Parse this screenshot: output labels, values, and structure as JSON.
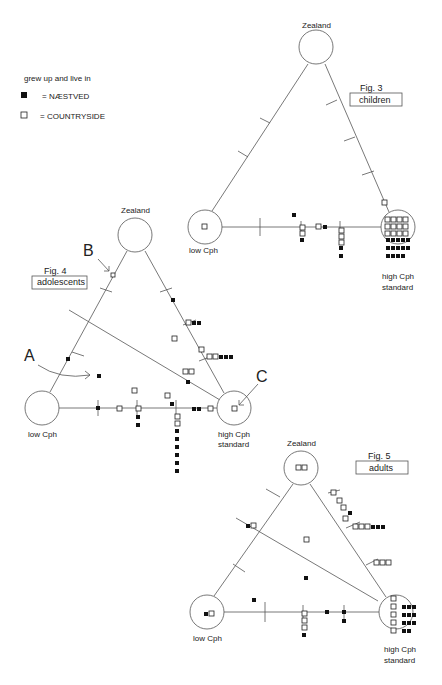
{
  "legend": {
    "title": "grew up and live in",
    "items": [
      {
        "symbol": "filled-square",
        "label": "= NÆSTVED"
      },
      {
        "symbol": "open-square",
        "label": "= COUNTRYSIDE"
      }
    ]
  },
  "figures": [
    {
      "id": "fig3",
      "fig_label": "Fig. 3",
      "group": "children",
      "vertices": {
        "top": "Zealand",
        "left": "low Cph",
        "right_line1": "high Cph",
        "right_line2": "standard"
      }
    },
    {
      "id": "fig4",
      "fig_label": "Fig. 4",
      "group": "adolescents",
      "vertices": {
        "top": "Zealand",
        "left": "low Cph",
        "right_line1": "high Cph",
        "right_line2": "standard"
      },
      "annotations": [
        "A",
        "B",
        "C"
      ]
    },
    {
      "id": "fig5",
      "fig_label": "Fig. 5",
      "group": "adults",
      "vertices": {
        "top": "Zealand",
        "left": "low Cph",
        "right_line1": "high Cph",
        "right_line2": "standard"
      }
    }
  ],
  "annotations": {
    "a": "A",
    "b": "B",
    "c": "C"
  }
}
